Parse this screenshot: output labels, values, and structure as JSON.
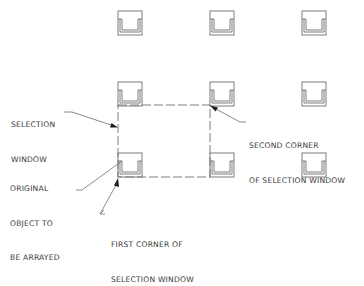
{
  "diagram": {
    "grid": {
      "columns_x": [
        118,
        210,
        302
      ],
      "rows_y": [
        11,
        82,
        153
      ],
      "object_size": 24,
      "original_object": {
        "col": 0,
        "row": 2
      }
    },
    "selection_window": {
      "x1": 118,
      "y1": 105,
      "x2": 210,
      "y2": 177
    },
    "labels": {
      "selection_window": [
        "SELECTION",
        "WINDOW"
      ],
      "second_corner": [
        "SECOND CORNER",
        "OF SELECTION WINDOW"
      ],
      "original_object": [
        "ORIGINAL",
        "OBJECT TO",
        "BE ARRAYED"
      ],
      "first_corner": [
        "FIRST CORNER OF",
        "SELECTION WINDOW"
      ]
    },
    "colors": {
      "line": "#6f6f6f",
      "arrow": "#1e1e1e",
      "text": "#3a3a3a",
      "background": "#ffffff"
    }
  }
}
